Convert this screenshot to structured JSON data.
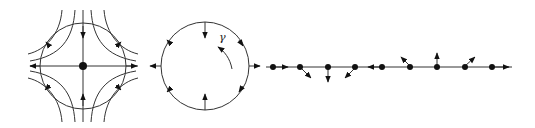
{
  "figure": {
    "background": "#ffffff",
    "stroke_color": "#333333",
    "panels": [
      {
        "id": "saddle-phase-portrait",
        "description": "Saddle point with separatrices and hyperbolic flow lines crossing a circle",
        "center": [
          83,
          66
        ],
        "circle_radius": 43
      },
      {
        "id": "circle-with-loop",
        "description": "Circle with outward/inward arrows and a curved arrow labeled gamma",
        "center": [
          205,
          66
        ],
        "circle_radius": 44,
        "label": "γ"
      },
      {
        "id": "line-of-points",
        "description": "Horizontal line with nine dots and direction arrows",
        "y": 67,
        "dot_x": [
          273,
          300,
          328,
          355,
          382,
          410,
          437,
          465,
          492
        ]
      }
    ]
  }
}
